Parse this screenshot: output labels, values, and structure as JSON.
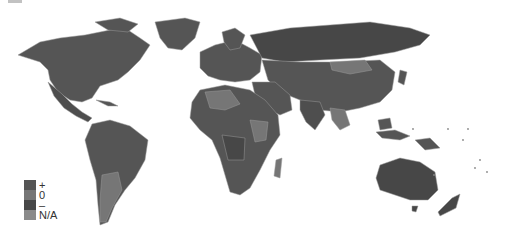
{
  "map": {
    "title": "",
    "projection": "world",
    "colors": {
      "plus": "#555555",
      "zero": "#767676",
      "minus": "#474747",
      "na": "#8a8a8a",
      "background": "#ffffff",
      "border": "#9a9a9a"
    }
  },
  "legend": {
    "items": [
      {
        "label": "+",
        "color": "#555555"
      },
      {
        "label": "0",
        "color": "#767676"
      },
      {
        "label": "–",
        "color": "#474747"
      },
      {
        "label": "N/A",
        "color": "#8a8a8a"
      }
    ]
  }
}
